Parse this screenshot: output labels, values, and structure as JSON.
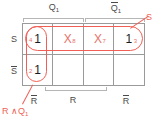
{
  "diagram": {
    "type": "karnaugh-map",
    "title": "",
    "column_group_labels": [
      {
        "id": "q1",
        "text": "Q",
        "sub": "1",
        "overline": false
      },
      {
        "id": "not-q1",
        "text": "Q",
        "sub": "1",
        "overline": true
      }
    ],
    "row_labels": [
      {
        "id": "s",
        "text": "S",
        "overline": false
      },
      {
        "id": "not-s",
        "text": "S",
        "overline": true
      }
    ],
    "column_labels": [
      {
        "id": "not-r-left",
        "text": "R",
        "overline": true
      },
      {
        "id": "r-middle",
        "text": "R",
        "overline": false
      },
      {
        "id": "not-r-right",
        "text": "R",
        "overline": true
      }
    ],
    "cells": [
      {
        "row": 0,
        "col": 0,
        "value": "1",
        "value_color": "black",
        "index": "4",
        "index_pos": "left"
      },
      {
        "row": 0,
        "col": 1,
        "value": "X",
        "value_color": "red",
        "index": "8",
        "index_pos": "right"
      },
      {
        "row": 0,
        "col": 2,
        "value": "X",
        "value_color": "red",
        "index": "7",
        "index_pos": "right"
      },
      {
        "row": 0,
        "col": 3,
        "value": "1",
        "value_color": "black",
        "index": "3",
        "index_pos": "right"
      },
      {
        "row": 1,
        "col": 0,
        "value": "1",
        "value_color": "black",
        "index": "2",
        "index_pos": "left"
      },
      {
        "row": 1,
        "col": 1,
        "value": "",
        "value_color": "black",
        "index": "",
        "index_pos": "right"
      },
      {
        "row": 1,
        "col": 2,
        "value": "",
        "value_color": "black",
        "index": "",
        "index_pos": "right"
      },
      {
        "row": 1,
        "col": 3,
        "value": "",
        "value_color": "black",
        "index": "",
        "index_pos": "right"
      }
    ],
    "groups": [
      {
        "id": "group-row-s",
        "shape": "oval",
        "label": "S"
      },
      {
        "id": "group-col-r-and-q1",
        "shape": "oval",
        "label": "R∧Q₁"
      }
    ],
    "annotations": [
      {
        "id": "annotation-s",
        "text": "S"
      },
      {
        "id": "annotation-r-and-q1",
        "text": "R ∧Q",
        "sub": "1"
      }
    ],
    "colors": {
      "group_red": "#ef5f55",
      "don_care_red": "#e8736a",
      "grid_gray": "#9a9a9a",
      "label_gray": "#4a4a4a",
      "background": "#ffffff"
    }
  }
}
